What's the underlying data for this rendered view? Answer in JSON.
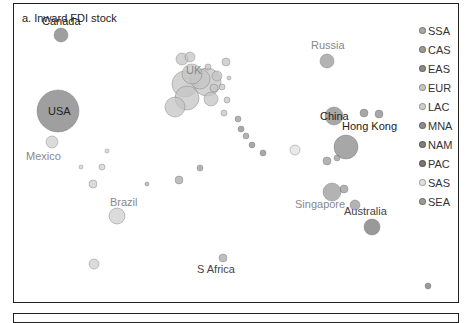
{
  "chart_data": {
    "type": "scatter",
    "title": "a. Inward FDI stock",
    "xlabel": "",
    "ylabel": "",
    "grid": false,
    "legend_position": "right",
    "legend": [
      {
        "code": "SSA",
        "color": "#a8a8a8"
      },
      {
        "code": "CAS",
        "color": "#9a9a9a"
      },
      {
        "code": "EAS",
        "color": "#8a8a8a"
      },
      {
        "code": "EUR",
        "color": "#c4c4c4"
      },
      {
        "code": "LAC",
        "color": "#cfcfcf"
      },
      {
        "code": "MNA",
        "color": "#8c8c8c"
      },
      {
        "code": "NAM",
        "color": "#7f7f7f"
      },
      {
        "code": "PAC",
        "color": "#777777"
      },
      {
        "code": "SAS",
        "color": "#e0e0e0"
      },
      {
        "code": "SEA",
        "color": "#999999"
      }
    ],
    "labeled_points": [
      {
        "name": "Canada",
        "region": "NAM",
        "x": 47,
        "y": 31,
        "r": 7
      },
      {
        "name": "USA",
        "region": "NAM",
        "x": 44,
        "y": 107,
        "r": 21
      },
      {
        "name": "Mexico",
        "region": "LAC",
        "x": 38,
        "y": 138,
        "r": 6
      },
      {
        "name": "Brazil",
        "region": "LAC",
        "x": 103,
        "y": 212,
        "r": 8
      },
      {
        "name": "UK",
        "region": "EUR",
        "x": 178,
        "y": 70,
        "r": 10
      },
      {
        "name": "Russia",
        "region": "CAS",
        "x": 313,
        "y": 57,
        "r": 7
      },
      {
        "name": "China",
        "region": "EAS",
        "x": 320,
        "y": 112,
        "r": 9
      },
      {
        "name": "Hong Kong",
        "region": "EAS",
        "x": 332,
        "y": 143,
        "r": 12
      },
      {
        "name": "Singapore",
        "region": "SEA",
        "x": 318,
        "y": 188,
        "r": 9
      },
      {
        "name": "S Africa",
        "region": "SSA",
        "x": 209,
        "y": 254,
        "r": 4
      },
      {
        "name": "Australia",
        "region": "PAC",
        "x": 358,
        "y": 223,
        "r": 8
      }
    ],
    "unlabeled_points": [
      {
        "region": "EUR",
        "x": 168,
        "y": 55,
        "r": 6
      },
      {
        "region": "EUR",
        "x": 176,
        "y": 53,
        "r": 5
      },
      {
        "region": "EUR",
        "x": 171,
        "y": 80,
        "r": 13
      },
      {
        "region": "EUR",
        "x": 193,
        "y": 78,
        "r": 14
      },
      {
        "region": "EUR",
        "x": 186,
        "y": 75,
        "r": 10
      },
      {
        "region": "EUR",
        "x": 173,
        "y": 94,
        "r": 12
      },
      {
        "region": "EUR",
        "x": 161,
        "y": 103,
        "r": 10
      },
      {
        "region": "EUR",
        "x": 197,
        "y": 95,
        "r": 7
      },
      {
        "region": "EUR",
        "x": 203,
        "y": 72,
        "r": 5
      },
      {
        "region": "EUR",
        "x": 212,
        "y": 58,
        "r": 4
      },
      {
        "region": "EUR",
        "x": 200,
        "y": 84,
        "r": 4
      },
      {
        "region": "EUR",
        "x": 208,
        "y": 83,
        "r": 3
      },
      {
        "region": "EUR",
        "x": 213,
        "y": 96,
        "r": 3
      },
      {
        "region": "EUR",
        "x": 210,
        "y": 109,
        "r": 3
      },
      {
        "region": "EUR",
        "x": 194,
        "y": 63,
        "r": 3
      },
      {
        "region": "EUR",
        "x": 215,
        "y": 74,
        "r": 2
      },
      {
        "region": "CAS",
        "x": 224,
        "y": 115,
        "r": 3
      },
      {
        "region": "CAS",
        "x": 232,
        "y": 132,
        "r": 3
      },
      {
        "region": "MNA",
        "x": 227,
        "y": 125,
        "r": 3
      },
      {
        "region": "MNA",
        "x": 238,
        "y": 141,
        "r": 3
      },
      {
        "region": "MNA",
        "x": 249,
        "y": 149,
        "r": 3
      },
      {
        "region": "CAS",
        "x": 186,
        "y": 164,
        "r": 3
      },
      {
        "region": "SSA",
        "x": 165,
        "y": 176,
        "r": 4
      },
      {
        "region": "SSA",
        "x": 133,
        "y": 180,
        "r": 2
      },
      {
        "region": "SAS",
        "x": 281,
        "y": 146,
        "r": 5
      },
      {
        "region": "EAS",
        "x": 350,
        "y": 109,
        "r": 4
      },
      {
        "region": "EAS",
        "x": 365,
        "y": 110,
        "r": 4
      },
      {
        "region": "SEA",
        "x": 313,
        "y": 157,
        "r": 4
      },
      {
        "region": "SEA",
        "x": 323,
        "y": 154,
        "r": 3
      },
      {
        "region": "SEA",
        "x": 341,
        "y": 201,
        "r": 5
      },
      {
        "region": "SEA",
        "x": 330,
        "y": 185,
        "r": 4
      },
      {
        "region": "LAC",
        "x": 79,
        "y": 180,
        "r": 4
      },
      {
        "region": "LAC",
        "x": 88,
        "y": 163,
        "r": 3
      },
      {
        "region": "LAC",
        "x": 80,
        "y": 260,
        "r": 5
      },
      {
        "region": "LAC",
        "x": 93,
        "y": 147,
        "r": 2
      },
      {
        "region": "LAC",
        "x": 67,
        "y": 163,
        "r": 2
      },
      {
        "region": "PAC",
        "x": 414,
        "y": 282,
        "r": 3
      }
    ]
  }
}
